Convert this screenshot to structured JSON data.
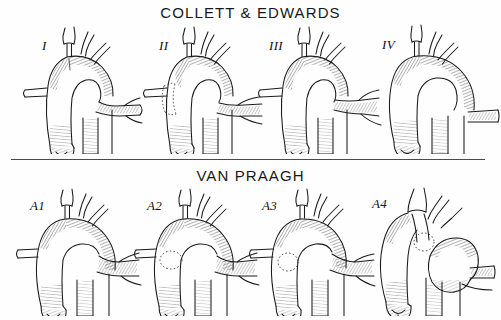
{
  "figure": {
    "caption_top": "COLLETT & EDWARDS",
    "caption_bottom": "VAN PRAAGH",
    "signature": "ih"
  },
  "sections": [
    {
      "id": "collett-edwards",
      "title": "COLLETT & EDWARDS",
      "figures": [
        {
          "label": "I",
          "description": "Common pulmonary trunk arises from truncus, branching into right and left pulmonary arteries"
        },
        {
          "label": "II",
          "description": "Right and left pulmonary arteries arise separately but adjacently from posterior truncus"
        },
        {
          "label": "III",
          "description": "Pulmonary arteries arise independently from lateral walls of the truncus"
        },
        {
          "label": "IV",
          "description": "Pulmonary arteries absent; lung supply from descending aorta collateral vessels"
        }
      ]
    },
    {
      "id": "van-praagh",
      "title": "VAN PRAAGH",
      "figures": [
        {
          "label": "A1",
          "description": "Partially separate pulmonary trunk present with ventricular septal defect"
        },
        {
          "label": "A2",
          "description": "Absent pulmonary trunk; pulmonary arteries arise directly and separately"
        },
        {
          "label": "A3",
          "description": "Absence of one pulmonary artery with collateral supply to that lung"
        },
        {
          "label": "A4",
          "description": "Truncus with interrupted or hypoplastic aortic arch"
        }
      ]
    },
    {
      "divider": {
        "present": true,
        "color": "#4a4a4a"
      }
    }
  ],
  "style": {
    "ink_color": "#1a1a1a",
    "background": "#fefefe",
    "hatch_color": "#2b2b2b",
    "technique": "pen-and-ink-hatching"
  }
}
